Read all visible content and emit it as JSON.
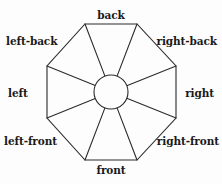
{
  "figure": {
    "type": "octagon-direction-wheel",
    "background_color": "#fdfdfd",
    "stroke_color": "#2b2b2b",
    "text_color": "#1a1a1a"
  },
  "labels": {
    "back": "back",
    "right_back": "right-back",
    "right": "right",
    "right_front": "right-front",
    "front": "front",
    "left_front": "left-front",
    "left": "left",
    "left_back": "left-back"
  },
  "geometry": {
    "center_x": 111,
    "center_y": 92,
    "inner_radius": 17,
    "octagon_vertices": [
      {
        "x": 85,
        "y": 24
      },
      {
        "x": 137,
        "y": 24
      },
      {
        "x": 176,
        "y": 66
      },
      {
        "x": 176,
        "y": 118
      },
      {
        "x": 137,
        "y": 160
      },
      {
        "x": 85,
        "y": 160
      },
      {
        "x": 47,
        "y": 118
      },
      {
        "x": 47,
        "y": 66
      }
    ],
    "sector_count": 8
  }
}
